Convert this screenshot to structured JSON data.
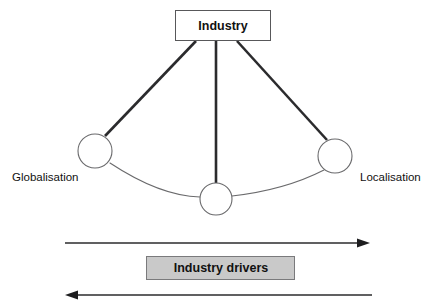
{
  "diagram": {
    "title_node": {
      "label": "Industry",
      "x": 175,
      "y": 10,
      "width": 95,
      "height": 31
    },
    "nodes": [
      {
        "name": "globalisation-node",
        "label": "Globalisation",
        "cx": 95,
        "cy": 151,
        "r": 17
      },
      {
        "name": "center-node",
        "label": "",
        "cx": 216,
        "cy": 199,
        "r": 16
      },
      {
        "name": "localisation-node",
        "label": "Localisation",
        "cx": 335,
        "cy": 156,
        "r": 17
      }
    ],
    "labels": {
      "left": "Globalisation",
      "right": "Localisation"
    },
    "drivers_bar": {
      "label": "Industry drivers",
      "x": 146,
      "y": 256,
      "width": 149,
      "height": 24,
      "fill": "#c9c9c9"
    },
    "arrows": [
      {
        "name": "arrow-right",
        "direction": "right",
        "x_start": 65,
        "x_end": 370,
        "y": 243
      },
      {
        "name": "arrow-left",
        "direction": "left",
        "x_start": 372,
        "x_end": 65,
        "y": 295
      }
    ],
    "colors": {
      "line": "#2b2b2d",
      "circle_stroke": "#6a6a6c",
      "box_stroke": "#58585a",
      "drivers_fill": "#c9c9c9",
      "text": "#111111",
      "background": "#ffffff"
    }
  }
}
